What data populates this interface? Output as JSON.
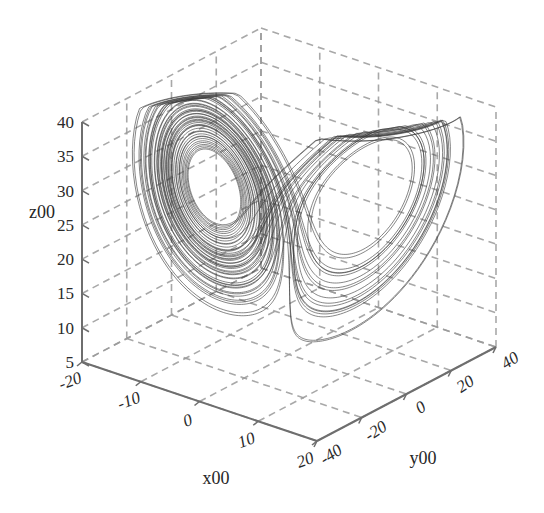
{
  "figure": {
    "background_color": "#ffffff",
    "width": 544,
    "height": 513
  },
  "chart_data": {
    "type": "line",
    "title": "",
    "subtitle": "",
    "plot_kind": "lorenz-attractor-3d",
    "projection": "3d-orthographic",
    "xlabel": "x00",
    "ylabel": "y00",
    "zlabel": "z00",
    "xlim": [
      -20,
      20
    ],
    "ylim": [
      -40,
      40
    ],
    "zlim": [
      5,
      40
    ],
    "xticks": [
      -20,
      -10,
      0,
      10,
      20
    ],
    "yticks": [
      -40,
      -20,
      0,
      20,
      40
    ],
    "zticks": [
      5,
      10,
      15,
      20,
      25,
      30,
      35,
      40
    ],
    "xtick_labels": [
      "-20",
      "-10",
      "0",
      "10",
      "20"
    ],
    "ytick_labels": [
      "-40",
      "-20",
      "0",
      "20",
      "40"
    ],
    "ztick_labels": [
      "5",
      "10",
      "15",
      "20",
      "25",
      "30",
      "35",
      "40"
    ],
    "grid": true,
    "grid_style": "dashed",
    "grid_color": "#9a9a9a",
    "axis_line_color": "#6e6e6e",
    "legend": null,
    "series": [
      {
        "name": "lorenz-trajectory",
        "color": "#3a3a3a",
        "line_width": 0.7,
        "equations": {
          "dx": "sigma*(y-x)",
          "dy": "x*(rho-z)-y",
          "dz": "x*y-beta*z"
        },
        "parameters": {
          "sigma": 10,
          "rho": 28,
          "beta": 2.6666666667
        },
        "initial_state": [
          0.8,
          0.8,
          24.0
        ],
        "dt": 0.006,
        "steps": 8200
      }
    ]
  },
  "axes": {
    "x_title": "x00",
    "y_title": "y00",
    "z_title": "z00"
  },
  "ticks": {
    "x": [
      "-20",
      "-10",
      "0",
      "10",
      "20"
    ],
    "y": [
      "-40",
      "-20",
      "0",
      "20",
      "40"
    ],
    "z": [
      "5",
      "10",
      "15",
      "20",
      "25",
      "30",
      "35",
      "40"
    ]
  }
}
